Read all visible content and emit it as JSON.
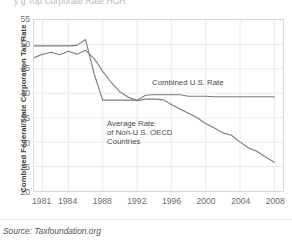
{
  "title_fragment": "y g      Top Corporate Rate   HGH",
  "axes": {
    "ylabel": "Combined Federal/State Corporation Tax Rate",
    "yticks": [
      55,
      50,
      45,
      40,
      35,
      30,
      25,
      20
    ],
    "ylim": [
      20,
      55
    ],
    "xticks": [
      "1981",
      "1984",
      "1988",
      "1992",
      "1996",
      "2000",
      "2004",
      "2008"
    ],
    "xtick_values": [
      1981,
      1984,
      1988,
      1992,
      1996,
      2000,
      2004,
      2008
    ],
    "xlim": [
      1980,
      2009
    ],
    "xlabel": ""
  },
  "annotations": {
    "us_line": "Combined U.S. Rate",
    "oecd_line_1": "Average Rate",
    "oecd_line_2": "of Non-U.S. OECD",
    "oecd_line_3": "Countries"
  },
  "source": "Source: Taxfoundation.org",
  "colors": {
    "line": "#7c7c7c",
    "grid": "#eaeaea",
    "frame": "#d8d8d8",
    "text": "#4a4a4a",
    "tick_text": "#6d6d6d",
    "background": "#ffffff"
  },
  "chart_data": {
    "type": "line",
    "title": "",
    "xlabel": "",
    "ylabel": "Combined Federal/State Corporation Tax Rate",
    "xlim": [
      1980,
      2009
    ],
    "ylim": [
      20,
      55
    ],
    "grid": true,
    "legend": "inline-annotations",
    "x": [
      1980,
      1981,
      1982,
      1983,
      1984,
      1985,
      1986,
      1987,
      1988,
      1989,
      1990,
      1991,
      1992,
      1993,
      1994,
      1995,
      1996,
      1997,
      1998,
      1999,
      2000,
      2001,
      2002,
      2003,
      2004,
      2005,
      2006,
      2007,
      2008
    ],
    "series": [
      {
        "name": "Combined U.S. Rate",
        "values": [
          49.7,
          49.7,
          49.7,
          49.7,
          49.7,
          49.8,
          51.0,
          44.0,
          38.6,
          38.6,
          38.6,
          38.6,
          38.6,
          39.6,
          39.7,
          39.7,
          39.7,
          39.7,
          39.4,
          39.4,
          39.4,
          39.3,
          39.3,
          39.3,
          39.3,
          39.3,
          39.3,
          39.3,
          39.3
        ]
      },
      {
        "name": "Average Rate of Non-U.S. OECD Countries",
        "values": [
          47.3,
          48.0,
          48.4,
          47.9,
          48.6,
          48.0,
          48.8,
          47.1,
          44.5,
          42.2,
          40.3,
          39.2,
          38.5,
          38.8,
          38.8,
          38.7,
          37.7,
          36.8,
          35.9,
          35.0,
          33.8,
          32.9,
          31.9,
          31.4,
          30.0,
          28.8,
          28.1,
          26.9,
          25.9
        ]
      }
    ]
  }
}
